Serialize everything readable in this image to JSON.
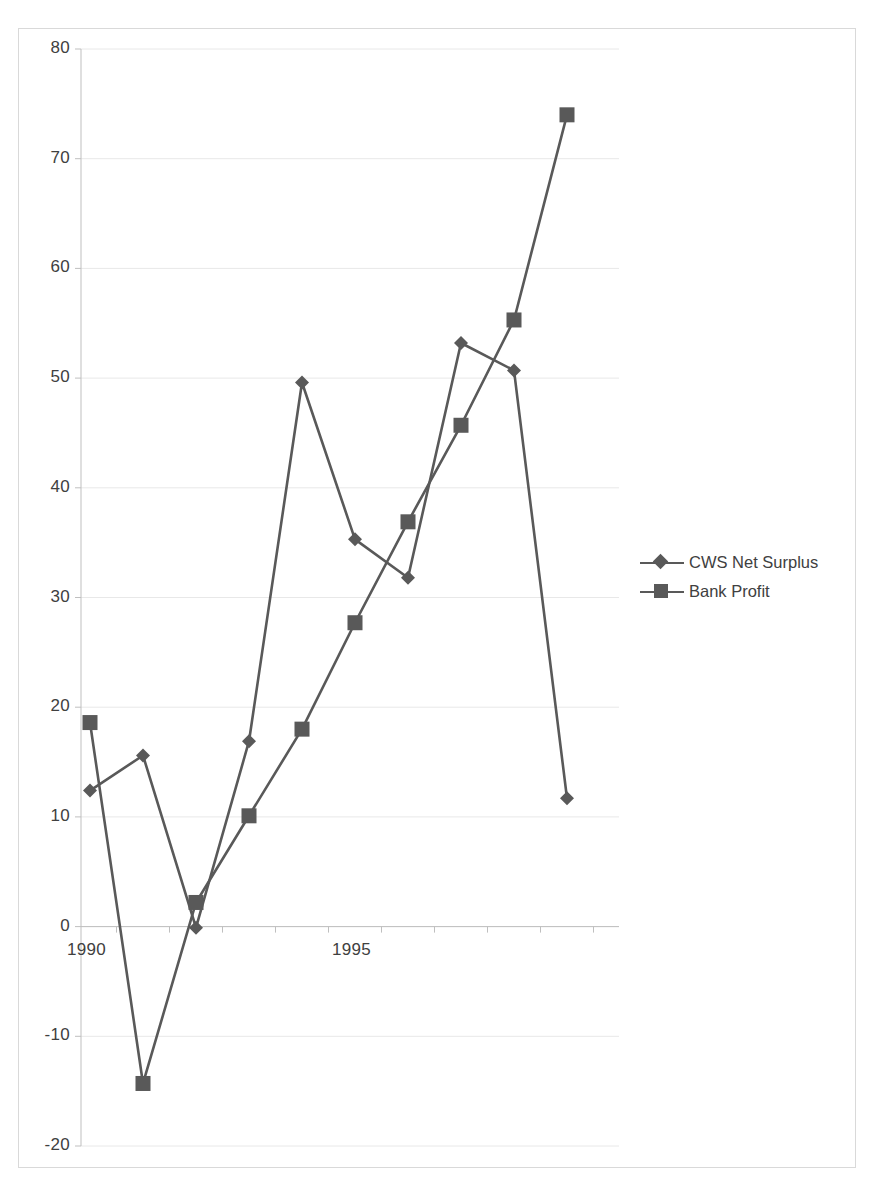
{
  "chart_data": {
    "type": "line",
    "title": "",
    "xlabel": "",
    "ylabel": "",
    "x": [
      1990,
      1991,
      1992,
      1993,
      1994,
      1995,
      1996,
      1997,
      1998,
      1999
    ],
    "categories": [
      "1990",
      "1991",
      "1992",
      "1993",
      "1994",
      "1995",
      "1996",
      "1997",
      "1998",
      "1999"
    ],
    "series": [
      {
        "name": "CWS Net Surplus",
        "marker": "diamond",
        "color": "#595959",
        "values": [
          12.4,
          15.6,
          -0.1,
          16.9,
          49.6,
          35.3,
          31.8,
          53.2,
          50.7,
          11.7
        ]
      },
      {
        "name": "Bank Profit",
        "marker": "square",
        "color": "#595959",
        "values": [
          18.6,
          -14.3,
          2.2,
          10.1,
          18.0,
          27.7,
          36.9,
          45.7,
          55.3,
          74.0
        ]
      }
    ],
    "ylim": [
      -20,
      80
    ],
    "xlim": [
      1989.5,
      1999.8
    ],
    "ytick_labels": [
      "80",
      "70",
      "60",
      "50",
      "40",
      "30",
      "20",
      "10",
      "0",
      "-10",
      "-20"
    ],
    "ytick_values": [
      80,
      70,
      60,
      50,
      40,
      30,
      20,
      10,
      0,
      -10,
      -20
    ],
    "xtick_labels": [
      "1990",
      "1995"
    ],
    "xtick_values": [
      1990,
      1995
    ],
    "grid": "horizontal",
    "legend_position": "right",
    "line_color": "#595959",
    "grid_color": "#e8e8e8",
    "axis_color": "#d9d9d9",
    "text_color": "#404040"
  },
  "legend": {
    "items": [
      {
        "label": "CWS Net Surplus"
      },
      {
        "label": "Bank Profit"
      }
    ]
  }
}
